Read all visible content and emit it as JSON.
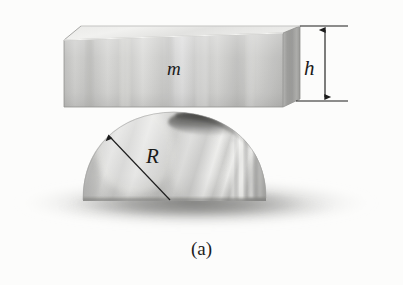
{
  "figure": {
    "caption": "(a)",
    "background_color": "#fcfcfb",
    "ink_color": "#1a1a1a",
    "labels": {
      "mass": "m",
      "height": "h",
      "radius": "R"
    },
    "objects": {
      "block": {
        "name": "rectangular block",
        "label": "m",
        "face_fill_light": "#d8d8d6",
        "face_fill_mid": "#b9b9b7",
        "face_fill_dark": "#9a9a98",
        "top_face_fill": "#e6e6e4",
        "right_face_fill": "#a2a2a0",
        "outline_color": "#8a8a88"
      },
      "dome": {
        "name": "hemisphere",
        "label": "R",
        "fill_light": "#e4e4e2",
        "fill_mid": "#c2c2c0",
        "fill_dark": "#9b9b99",
        "contact_shadow_color": "#4a4a48"
      },
      "ground_shadow": {
        "name": "ground shadow",
        "color": "#8e8e8c"
      }
    },
    "dimensions": {
      "height_arrow": {
        "name": "h dimension arrow",
        "label": "h",
        "type": "double-headed vertical arrow with extension lines"
      },
      "radius_arrow": {
        "name": "R radius arrow",
        "label": "R",
        "type": "single-headed arrow from dome center to dome surface"
      }
    }
  }
}
